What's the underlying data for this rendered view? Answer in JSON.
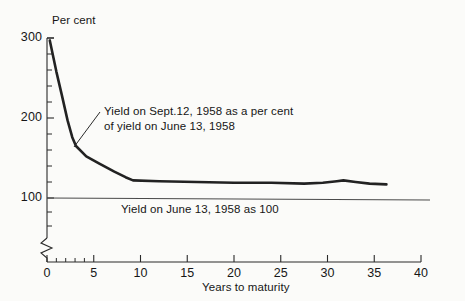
{
  "chart_data": {
    "type": "line",
    "title": "",
    "xlabel": "Years to maturity",
    "ylabel": "Per cent",
    "xlim": [
      0,
      40
    ],
    "ylim": [
      100,
      300
    ],
    "grid": false,
    "legend_position": "none",
    "y_axis_break": true,
    "y_axis_break_note": "axis broken between 0 and 100",
    "xticks": [
      0,
      5,
      10,
      15,
      20,
      25,
      30,
      35,
      40
    ],
    "xtick_labels": [
      "0",
      "5",
      "10",
      "15",
      "20",
      "25",
      "30",
      "35",
      "40"
    ],
    "x_minor_ticks": [
      1,
      2,
      3,
      4
    ],
    "yticks": [
      100,
      200,
      300
    ],
    "ytick_labels": [
      "100",
      "200",
      "300"
    ],
    "y_minor_ticks": [
      120,
      140,
      160,
      180,
      220,
      240,
      260,
      280
    ],
    "reference_line": {
      "value": 100,
      "label": "Yield on June 13, 1958 as 100"
    },
    "series": [
      {
        "name": "Yield on Sept. 12, 1958 as a per cent of yield on June 13, 1958",
        "x": [
          0.3,
          1.0,
          1.6,
          2.2,
          2.7,
          3.1,
          4.2,
          5.6,
          7.2,
          8.4,
          9.2,
          12.0,
          16.0,
          20.0,
          24.0,
          27.5,
          29.5,
          31.0,
          31.7,
          33.0,
          34.5,
          36.3
        ],
        "y": [
          297,
          258,
          228,
          197,
          176,
          165,
          152,
          143,
          133,
          126,
          122,
          121,
          120,
          119,
          119,
          118,
          119,
          121,
          122,
          120,
          118,
          117
        ]
      }
    ],
    "annotations": [
      {
        "text_line1": "Yield on Sept.12, 1958 as a per cent",
        "text_line2": "of yield on June 13, 1958",
        "points_to_x": 3.1,
        "points_to_y": 165
      }
    ]
  },
  "axis": {
    "y_title": "Per cent",
    "x_title": "Years to maturity"
  },
  "colors": {
    "ink": "#1c1c1c",
    "paper": "#fbfbf9",
    "data_line": "#222222",
    "reference_line": "#4a4a4a",
    "axis": "#2a2a2a"
  }
}
